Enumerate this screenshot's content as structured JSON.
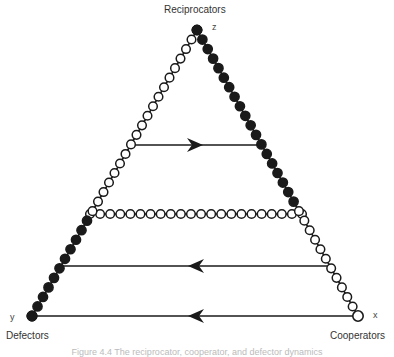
{
  "labels": {
    "top_title": "Reciprocators",
    "top_vertex": "z",
    "left_title": "Defectors",
    "left_vertex": "y",
    "right_title": "Cooperators",
    "right_vertex": "x"
  },
  "caption": "Figure 4.4 The reciprocator, cooperator, and defector dynamics",
  "geometry": {
    "top": [
      197,
      30
    ],
    "left": [
      32,
      316
    ],
    "right": [
      358,
      316
    ],
    "lines": [
      {
        "y": 145,
        "x1": 134,
        "x2": 266,
        "arrow_x": 203,
        "direction": "right",
        "style": "solid"
      },
      {
        "y": 214,
        "x1": 90,
        "x2": 302,
        "direction": "none",
        "style": "open-circles"
      },
      {
        "y": 266,
        "x1": 62,
        "x2": 330,
        "arrow_x": 188,
        "direction": "left",
        "style": "solid"
      },
      {
        "y": 316,
        "x1": 32,
        "x2": 358,
        "arrow_x": 188,
        "direction": "left",
        "style": "solid"
      }
    ],
    "left_side_open_until_y": 214,
    "right_side_filled_until_y": 205
  },
  "colors": {
    "stroke": "#1a1a1a",
    "fill": "#1a1a1a",
    "open": "#ffffff"
  }
}
